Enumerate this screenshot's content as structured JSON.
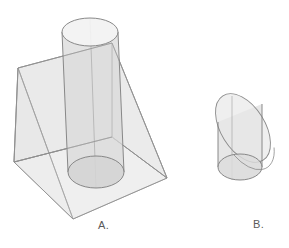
{
  "figure": {
    "title": "",
    "background_color": "#ffffff",
    "stroke_color": "#8a8a8a",
    "stroke_color_dark": "#6e6e6e",
    "fill_color": "#e6e6e6",
    "fill_color_light": "#efefef",
    "fill_color_shade": "#dcdcdc",
    "label_color": "#5a5a5a",
    "shapes": [
      {
        "id": "A",
        "label": "A.",
        "name": "triangular-wedge-with-cylinder",
        "description": "Transparent triangular prism (wedge) with a vertical circular cylinder passing through it",
        "parts": [
          "triangular-prism",
          "vertical-cylinder"
        ]
      },
      {
        "id": "B",
        "label": "B.",
        "name": "obliquely-cut-cylinder",
        "description": "Transparent circular cylinder truncated by an oblique plane, producing an elliptical top face",
        "parts": [
          "cylinder-body",
          "oblique-elliptical-section"
        ]
      }
    ]
  },
  "labels": {
    "a": "A.",
    "b": "B."
  }
}
